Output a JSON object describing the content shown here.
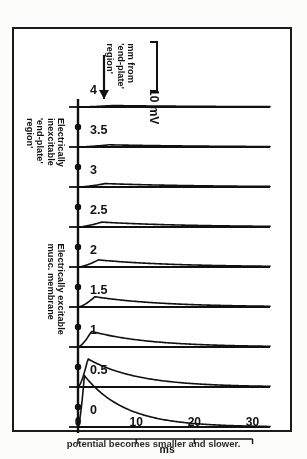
{
  "figure": {
    "orientation": "rotated-180",
    "caption_fragment": "potential becomes smaller and slower.",
    "scale_bar": {
      "label": "10 mV",
      "value": 10,
      "unit": "mV"
    },
    "distance_axis": {
      "title_line1": "mm from",
      "title_line2": "'end-plate'",
      "title_line3": "region'",
      "arrow": "up-arrow"
    },
    "region_labels": {
      "inexcitable": {
        "line1": "Electrically",
        "line2": "inexcitable",
        "line3": "'end-plate'",
        "line4": "region'"
      },
      "excitable": {
        "line1": "Electrically excitable",
        "line2": "musc. membrane"
      }
    }
  },
  "chart_data": {
    "type": "line",
    "xlabel": "ms",
    "ylabel": "mm from 'end-plate' region'",
    "xlim": [
      0,
      33
    ],
    "ylim": [
      0,
      4.4
    ],
    "grid": false,
    "legend": "none",
    "x_ticks": [
      0,
      10,
      20,
      30
    ],
    "x_tick_labels": [
      "0",
      "10",
      "20",
      "30"
    ],
    "x_unit": "ms",
    "trace_labels": [
      "0",
      "0.5",
      "1",
      "1.5",
      "2",
      "2.5",
      "3",
      "3.5",
      "4"
    ],
    "trace_distances_mm": [
      0,
      0.5,
      1,
      1.5,
      2,
      2.5,
      3,
      3.5,
      4
    ],
    "amplitude_unit": "mV",
    "series": [
      {
        "name": "0",
        "distance_mm": 0,
        "peak_mv": 21.0,
        "rise_ms": 1.1,
        "decay_ms": 7.0
      },
      {
        "name": "0.5",
        "distance_mm": 0.5,
        "peak_mv": 11.5,
        "rise_ms": 1.7,
        "decay_ms": 8.5
      },
      {
        "name": "1",
        "distance_mm": 1.0,
        "peak_mv": 6.4,
        "rise_ms": 2.3,
        "decay_ms": 10.0
      },
      {
        "name": "1.5",
        "distance_mm": 1.5,
        "peak_mv": 4.2,
        "rise_ms": 2.9,
        "decay_ms": 11.5
      },
      {
        "name": "2",
        "distance_mm": 2.0,
        "peak_mv": 2.9,
        "rise_ms": 3.5,
        "decay_ms": 13.0
      },
      {
        "name": "2.5",
        "distance_mm": 2.5,
        "peak_mv": 2.0,
        "rise_ms": 4.1,
        "decay_ms": 14.5
      },
      {
        "name": "3",
        "distance_mm": 3.0,
        "peak_mv": 1.4,
        "rise_ms": 4.7,
        "decay_ms": 16.0
      },
      {
        "name": "3.5",
        "distance_mm": 3.5,
        "peak_mv": 0.9,
        "rise_ms": 5.3,
        "decay_ms": 17.5
      },
      {
        "name": "4",
        "distance_mm": 4.0,
        "peak_mv": 0.6,
        "rise_ms": 5.9,
        "decay_ms": 19.0
      }
    ],
    "electrode_marker_distances_mm": [
      0,
      0.5,
      1,
      1.5,
      2,
      2.5,
      3,
      3.5,
      4
    ],
    "colors": {
      "ink": "#111111",
      "paper": "#ffffff"
    }
  }
}
